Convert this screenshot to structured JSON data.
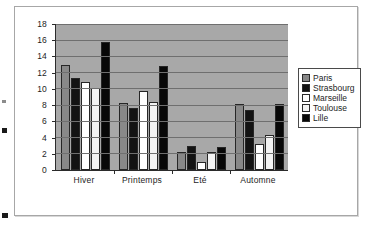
{
  "chart_data": {
    "type": "bar",
    "title": "",
    "xlabel": "",
    "ylabel": "",
    "categories": [
      "Hiver",
      "Printemps",
      "Eté",
      "Automne"
    ],
    "series": [
      {
        "name": "Paris",
        "color": "#888888",
        "values": [
          13.0,
          8.3,
          2.2,
          8.1
        ]
      },
      {
        "name": "Strasbourg",
        "color": "#131313",
        "values": [
          11.4,
          7.6,
          3.0,
          7.4
        ]
      },
      {
        "name": "Marseille",
        "color": "#ffffff",
        "values": [
          10.9,
          9.7,
          1.0,
          3.2
        ]
      },
      {
        "name": "Toulouse",
        "color": "#f3f3f3",
        "values": [
          10.1,
          8.4,
          2.2,
          4.3
        ]
      },
      {
        "name": "Lille",
        "color": "#080808",
        "values": [
          15.8,
          12.8,
          2.8,
          8.2
        ]
      }
    ],
    "ylim": [
      0,
      18
    ],
    "ytick_step": 2,
    "yticks": [
      "18",
      "16",
      "14",
      "12",
      "10",
      "8",
      "6",
      "4",
      "2",
      "0"
    ],
    "grid": true,
    "legend_position": "right",
    "plot_background": "#a8a8a8"
  },
  "legend": {
    "items": [
      {
        "label": "Paris"
      },
      {
        "label": "Strasbourg"
      },
      {
        "label": "Marseille"
      },
      {
        "label": "Toulouse"
      },
      {
        "label": "Lille"
      }
    ]
  }
}
